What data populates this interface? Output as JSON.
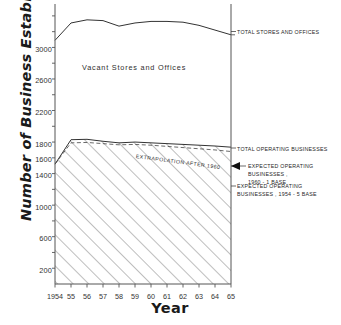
{
  "chart_data": {
    "type": "line",
    "title": "",
    "xlabel": "Year",
    "ylabel": "Number of Business Establishments",
    "xlim": [
      1954,
      1965
    ],
    "ylim": [
      0,
      3500
    ],
    "grid": false,
    "legend_position": "right-annotations",
    "x": [
      1954,
      1955,
      1956,
      1957,
      1958,
      1959,
      1960,
      1961,
      1962,
      1963,
      1964,
      1965
    ],
    "xticklabels": [
      "1954",
      "55",
      "56",
      "57",
      "58",
      "59",
      "60",
      "61",
      "62",
      "63",
      "64",
      "65"
    ],
    "yticklabels": [
      "200",
      "600",
      "1000",
      "1400",
      "1600",
      "1800",
      "2200",
      "2600",
      "3000"
    ],
    "yticks": [
      200,
      600,
      1000,
      1400,
      1600,
      1800,
      2200,
      2600,
      3000
    ],
    "minor_tick_interval": 200,
    "series": [
      {
        "name": "TOTAL STORES AND OFFICES",
        "style": "solid",
        "values": [
          3090,
          3310,
          3350,
          3340,
          3270,
          3310,
          3330,
          3330,
          3320,
          3280,
          3220,
          3160
        ]
      },
      {
        "name": "TOTAL OPERATING BUSINESSES",
        "style": "solid",
        "values": [
          1520,
          1830,
          1835,
          1810,
          1790,
          1800,
          1790,
          1780,
          1770,
          1760,
          1750,
          1735
        ]
      },
      {
        "name": "EXPECTED OPERATING BUSINESSES, 1960 - 1 BASE",
        "style": "dashed",
        "note": "EXTRAPOLATION AFTER 1960",
        "values": [
          1520,
          1790,
          1795,
          1780,
          1765,
          1770,
          1760,
          1745,
          1730,
          1715,
          1700,
          1680
        ]
      },
      {
        "name": "EXPECTED OPERATING BUSINESSES, 1954 - 5 BASE",
        "style": "hatched-area-boundary",
        "values": [
          1520,
          1830,
          1835,
          1810,
          1790,
          1800,
          1790,
          1780,
          1770,
          1760,
          1750,
          1735
        ]
      }
    ],
    "region_labels": [
      {
        "text": "Vacant Stores and Offices",
        "between": [
          "TOTAL STORES AND OFFICES",
          "TOTAL OPERATING BUSINESSES"
        ]
      }
    ],
    "annotations": [
      {
        "text": "TOTAL STORES AND OFFICES",
        "anchor_year": 1965,
        "anchor_value": 3160
      },
      {
        "text": "TOTAL OPERATING BUSINESSES",
        "anchor_year": 1965,
        "anchor_value": 1735
      },
      {
        "text": "EXPECTED OPERATING BUSINESSES,\n1960 - 1 BASE",
        "anchor_year": 1965,
        "anchor_value": 1620
      },
      {
        "text": "EXPECTED OPERATING\nBUSINESSES , 1954 - 5 BASE",
        "anchor_year": 1965,
        "anchor_value": 1440
      },
      {
        "text": "EXTRAPOLATION AFTER 1960",
        "anchor_year": 1960,
        "anchor_value": 1660
      }
    ]
  },
  "axes": {
    "ylabel": "Number of Business Establishments",
    "xlabel": "Year",
    "yticks": [
      "3000",
      "2600",
      "2200",
      "1800",
      "1600",
      "1400",
      "1000",
      "600",
      "200"
    ],
    "xticks": [
      "1954",
      "55",
      "56",
      "57",
      "58",
      "59",
      "60",
      "61",
      "62",
      "63",
      "64",
      "65"
    ]
  },
  "annotations": {
    "total_stores": "TOTAL STORES AND OFFICES",
    "total_operating": "TOTAL OPERATING BUSINESSES",
    "expected_1960": "EXPECTED OPERATING BUSINESSES ,\n1960 - 1 BASE",
    "expected_1954": "EXPECTED OPERATING\nBUSINESSES , 1954 - 5 BASE",
    "vacant": "Vacant Stores and Offices",
    "extrapolation": "EXTRAPOLATION AFTER 1960"
  },
  "colors": {
    "line": "#333333",
    "text": "#262626",
    "background": "#ffffff"
  }
}
